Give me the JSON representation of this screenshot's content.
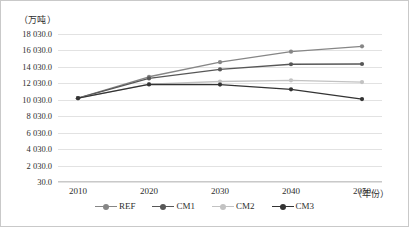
{
  "chart_data": {
    "type": "line",
    "title": "",
    "subtitle": "",
    "unit_label": "（万吨）",
    "xlabel": "（年份）",
    "ylabel": "",
    "categories": [
      "2010",
      "2020",
      "2030",
      "2040",
      "2050"
    ],
    "x": [
      2010,
      2020,
      2030,
      2040,
      2050
    ],
    "ylim": [
      30.0,
      18030.0
    ],
    "ytick_step": 2000,
    "ytick_labels": [
      "18 030.0",
      "16 030.0",
      "14 030.0",
      "12 030.0",
      "10 030.0",
      "8 030.0",
      "6 030.0",
      "4 030.0",
      "2 030.0",
      "30.0"
    ],
    "ytick_values": [
      18030.0,
      16030.0,
      14030.0,
      12030.0,
      10030.0,
      8030.0,
      6030.0,
      4030.0,
      2030.0,
      30.0
    ],
    "grid": true,
    "legend_position": "bottom",
    "markers": "circle",
    "series": [
      {
        "name": "REF",
        "color": "#868686",
        "values": [
          10230,
          12830,
          14600,
          15880,
          16530
        ]
      },
      {
        "name": "CM1",
        "color": "#575757",
        "values": [
          10230,
          12630,
          13720,
          14350,
          14380
        ]
      },
      {
        "name": "CM2",
        "color": "#c2c2c2",
        "values": [
          10230,
          11930,
          12250,
          12400,
          12180
        ]
      },
      {
        "name": "CM3",
        "color": "#333333",
        "values": [
          10230,
          11900,
          11880,
          11300,
          10120
        ]
      }
    ]
  },
  "legend": {
    "items": [
      {
        "label": "REF"
      },
      {
        "label": "CM1"
      },
      {
        "label": "CM2"
      },
      {
        "label": "CM3"
      }
    ]
  },
  "colors": {
    "grid": "#e2e2e2",
    "frame": "#c9c9c9",
    "text": "#2e2e2e",
    "background": "#ffffff"
  }
}
